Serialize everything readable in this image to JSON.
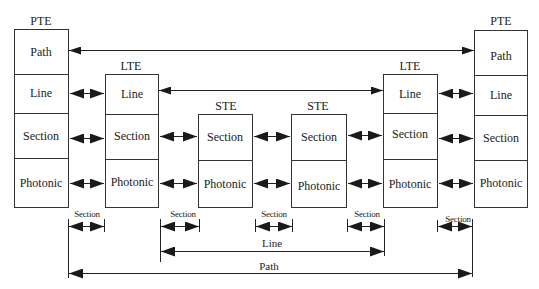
{
  "diagram": {
    "type": "SONET network layers",
    "nodes": [
      {
        "id": "pte-left",
        "title": "PTE",
        "layers": [
          "Path",
          "Line",
          "Section",
          "Photonic"
        ]
      },
      {
        "id": "lte-left",
        "title": "LTE",
        "layers": [
          "Line",
          "Section",
          "Photonic"
        ]
      },
      {
        "id": "ste-1",
        "title": "STE",
        "layers": [
          "Section",
          "Photonic"
        ]
      },
      {
        "id": "ste-2",
        "title": "STE",
        "layers": [
          "Section",
          "Photonic"
        ]
      },
      {
        "id": "lte-right",
        "title": "LTE",
        "layers": [
          "Line",
          "Section",
          "Photonic"
        ]
      },
      {
        "id": "pte-right",
        "title": "PTE",
        "layers": [
          "Path",
          "Line",
          "Section",
          "Photonic"
        ]
      }
    ],
    "spans": {
      "section": "Section",
      "line": "Line",
      "path": "Path"
    },
    "section_spans": [
      "Section",
      "Section",
      "Section",
      "Section",
      "Section"
    ]
  }
}
